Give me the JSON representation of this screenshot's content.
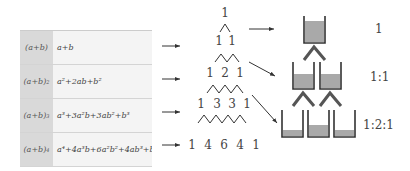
{
  "table": {
    "rows": [
      {
        "lhs": "(a+b)",
        "lhs_exp": "",
        "rhs": "a+b"
      },
      {
        "lhs": "(a+b)",
        "lhs_exp": "2",
        "rhs": "a²+2ab+b²"
      },
      {
        "lhs": "(a+b)",
        "lhs_exp": "3",
        "rhs": "a³+3a²b+3ab²+b³"
      },
      {
        "lhs": "(a+b)",
        "lhs_exp": "4",
        "rhs": "a⁴+4a³b+6a²b²+4ab³+b⁴"
      }
    ]
  },
  "pascal": {
    "rows": [
      [
        "1"
      ],
      [
        "1",
        "1"
      ],
      [
        "1",
        "2",
        "1"
      ],
      [
        "1",
        "3",
        "3",
        "1"
      ],
      [
        "1",
        "4",
        "6",
        "4",
        "1"
      ]
    ]
  },
  "ratios": {
    "r1": "1",
    "r2": "1:1",
    "r3": "1:2:1"
  },
  "colors": {
    "water": "#a9a9a9",
    "container": "#333333",
    "lhs_bg": "#d9d9d9",
    "rhs_bg": "#f4f4f4"
  }
}
